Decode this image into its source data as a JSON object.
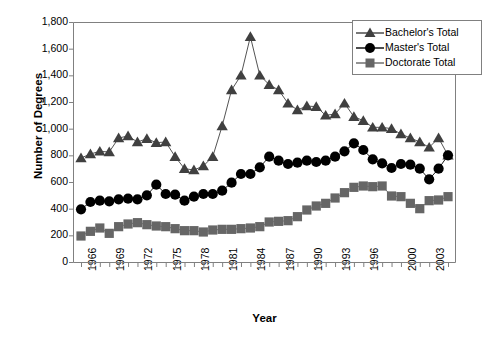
{
  "chart_data": {
    "type": "line",
    "title": "",
    "xlabel": "Year",
    "ylabel": "Number of Degrees",
    "xlim": [
      1966,
      2005
    ],
    "ylim": [
      0,
      1800
    ],
    "ytick_step": 200,
    "grid": false,
    "legend_position": "top-right",
    "yticks": [
      "1,800",
      "1,600",
      "1,400",
      "1,200",
      "1,000",
      "800",
      "600",
      "400",
      "200",
      "0"
    ],
    "ytick_values": [
      1800,
      1600,
      1400,
      1200,
      1000,
      800,
      600,
      400,
      200,
      0
    ],
    "xticks": [
      "1966",
      "1969",
      "1972",
      "1975",
      "1978",
      "1981",
      "1984",
      "1987",
      "1990",
      "1993",
      "1996",
      "2000",
      "2003"
    ],
    "xtick_values": [
      1966,
      1969,
      1972,
      1975,
      1978,
      1981,
      1984,
      1987,
      1990,
      1993,
      1996,
      2000,
      2003
    ],
    "x": [
      1966,
      1967,
      1968,
      1969,
      1970,
      1971,
      1972,
      1973,
      1974,
      1975,
      1976,
      1977,
      1978,
      1979,
      1980,
      1981,
      1982,
      1983,
      1984,
      1985,
      1986,
      1987,
      1988,
      1989,
      1990,
      1991,
      1992,
      1993,
      1994,
      1995,
      1996,
      1997,
      1998,
      1999,
      2000,
      2001,
      2002,
      2003,
      2004,
      2005
    ],
    "series": [
      {
        "name": "Bachelor's Total",
        "marker": "triangle",
        "color": "#404040",
        "values": [
          780,
          810,
          830,
          825,
          930,
          945,
          900,
          925,
          895,
          900,
          790,
          700,
          690,
          720,
          790,
          1020,
          1290,
          1400,
          1690,
          1400,
          1330,
          1290,
          1190,
          1140,
          1170,
          1165,
          1100,
          1110,
          1190,
          1090,
          1060,
          1010,
          1010,
          1000,
          960,
          930,
          900,
          860,
          930,
          800
        ]
      },
      {
        "name": "Master's Total",
        "marker": "circle",
        "color": "#000000",
        "values": [
          395,
          450,
          460,
          455,
          470,
          475,
          470,
          500,
          580,
          510,
          505,
          460,
          490,
          510,
          510,
          535,
          595,
          660,
          660,
          710,
          790,
          760,
          735,
          745,
          760,
          750,
          760,
          790,
          830,
          890,
          840,
          770,
          740,
          705,
          735,
          730,
          700,
          620,
          700,
          800
        ]
      },
      {
        "name": "Doctorate Total",
        "marker": "square",
        "color": "#666666",
        "values": [
          195,
          230,
          255,
          215,
          265,
          285,
          295,
          280,
          270,
          265,
          250,
          235,
          235,
          225,
          240,
          245,
          245,
          250,
          255,
          265,
          300,
          305,
          310,
          340,
          390,
          420,
          440,
          480,
          520,
          560,
          570,
          565,
          570,
          495,
          490,
          440,
          400,
          460,
          465,
          490
        ]
      }
    ]
  },
  "legend": {
    "items": [
      {
        "label": "Bachelor's Total",
        "marker": "triangle",
        "color": "#404040"
      },
      {
        "label": "Master's Total",
        "marker": "circle",
        "color": "#000000"
      },
      {
        "label": "Doctorate Total",
        "marker": "square",
        "color": "#666666"
      }
    ]
  }
}
